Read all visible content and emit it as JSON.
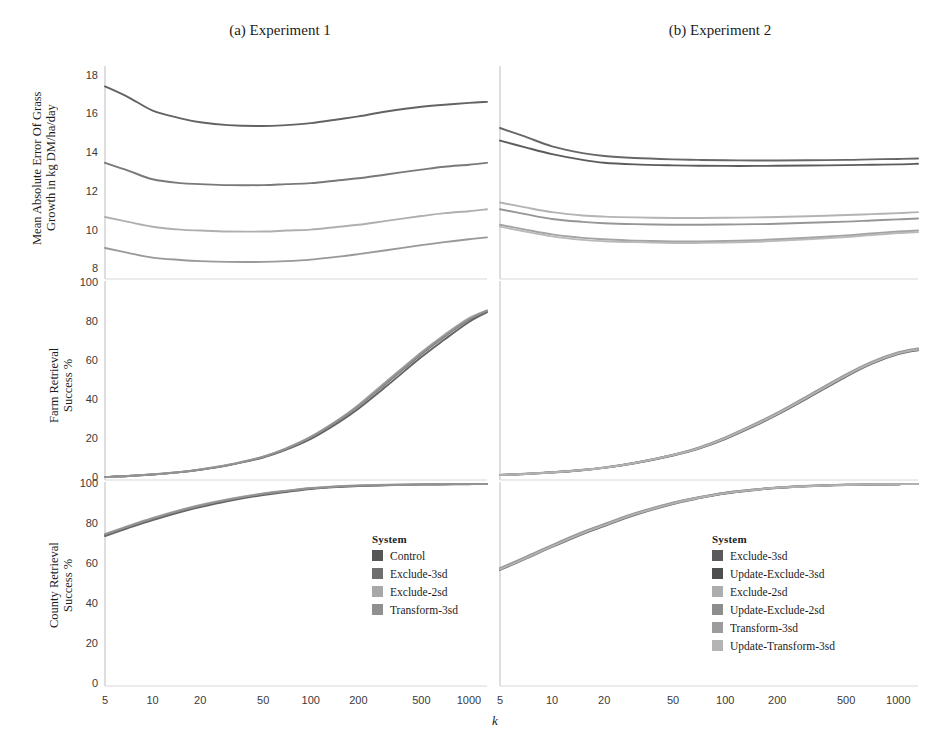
{
  "figure": {
    "panel_titles": [
      "(a) Experiment 1",
      "(b) Experiment 2"
    ],
    "xlabel": "k"
  },
  "axes": {
    "mae_title": "Mean Absolute Error Of Grass\nGrowth in kg DM/ha/day",
    "farm_title": "Farm Retrieval\nSuccess %",
    "county_title": "County Retrieval\nSuccess %",
    "mae_ticks": [
      "8",
      "10",
      "12",
      "14",
      "16",
      "18"
    ],
    "pct_ticks": [
      "0",
      "20",
      "40",
      "60",
      "80",
      "100"
    ],
    "x_ticks": [
      "5",
      "10",
      "20",
      "50",
      "100",
      "200",
      "500",
      "1000"
    ]
  },
  "legends": {
    "a": {
      "title": "System",
      "items": [
        {
          "label": "Control",
          "color": "#565656"
        },
        {
          "label": "Exclude-3sd",
          "color": "#6e6e6e"
        },
        {
          "label": "Exclude-2sd",
          "color": "#a8a8a8"
        },
        {
          "label": "Transform-3sd",
          "color": "#909090"
        }
      ]
    },
    "b": {
      "title": "System",
      "items": [
        {
          "label": "Exclude-3sd",
          "color": "#5a5a5a"
        },
        {
          "label": "Update-Exclude-3sd",
          "color": "#4e4e4e"
        },
        {
          "label": "Exclude-2sd",
          "color": "#adadad"
        },
        {
          "label": "Update-Exclude-2sd",
          "color": "#8d8d8d"
        },
        {
          "label": "Transform-3sd",
          "color": "#9c9c9c"
        },
        {
          "label": "Update-Transform-3sd",
          "color": "#b4b4b4"
        }
      ]
    }
  },
  "chart_data": [
    {
      "type": "line",
      "title": "(a) Experiment 1 — Mean Absolute Error",
      "xlabel": "k",
      "ylabel": "Mean Absolute Error Of Grass Growth in kg DM/ha/day",
      "xscale": "log",
      "xlim": [
        5,
        1300
      ],
      "ylim": [
        7.6,
        18.4
      ],
      "x": [
        5,
        7,
        10,
        15,
        20,
        30,
        50,
        70,
        100,
        150,
        200,
        300,
        500,
        700,
        1000,
        1300
      ],
      "series": [
        {
          "name": "Control",
          "color": "#565656",
          "values": [
            17.45,
            16.9,
            16.2,
            15.8,
            15.6,
            15.45,
            15.4,
            15.45,
            15.55,
            15.75,
            15.9,
            16.15,
            16.4,
            16.5,
            16.6,
            16.65
          ]
        },
        {
          "name": "Exclude-3sd",
          "color": "#6e6e6e",
          "values": [
            13.5,
            13.1,
            12.65,
            12.45,
            12.4,
            12.35,
            12.35,
            12.4,
            12.45,
            12.6,
            12.7,
            12.9,
            13.15,
            13.3,
            13.4,
            13.5
          ]
        },
        {
          "name": "Exclude-2sd",
          "color": "#a8a8a8",
          "values": [
            10.7,
            10.45,
            10.2,
            10.05,
            10.0,
            9.95,
            9.95,
            10.0,
            10.05,
            10.2,
            10.3,
            10.5,
            10.75,
            10.9,
            11.0,
            11.1
          ]
        },
        {
          "name": "Transform-3sd",
          "color": "#909090",
          "values": [
            9.1,
            8.85,
            8.6,
            8.48,
            8.42,
            8.38,
            8.38,
            8.42,
            8.5,
            8.65,
            8.78,
            8.98,
            9.25,
            9.4,
            9.55,
            9.65
          ]
        }
      ]
    },
    {
      "type": "line",
      "title": "(a) Experiment 1 — Farm Retrieval Success",
      "xlabel": "k",
      "ylabel": "Farm Retrieval Success %",
      "xscale": "log",
      "xlim": [
        5,
        1300
      ],
      "ylim": [
        0,
        100
      ],
      "x": [
        5,
        7,
        10,
        15,
        20,
        30,
        50,
        70,
        100,
        150,
        200,
        300,
        500,
        700,
        1000,
        1300
      ],
      "series": [
        {
          "name": "Control",
          "color": "#565656",
          "values": [
            0.5,
            1.0,
            1.8,
            3.0,
            4.2,
            6.5,
            10.5,
            14.5,
            20.0,
            28.5,
            35.5,
            47.0,
            62.0,
            71.0,
            80.0,
            85.0
          ]
        },
        {
          "name": "Exclude-3sd",
          "color": "#6e6e6e",
          "values": [
            0.5,
            1.0,
            1.8,
            3.0,
            4.3,
            6.6,
            10.8,
            15.0,
            20.8,
            29.5,
            36.8,
            48.5,
            63.5,
            72.5,
            81.0,
            85.5
          ]
        },
        {
          "name": "Exclude-2sd",
          "color": "#a8a8a8",
          "values": [
            0.5,
            1.0,
            1.9,
            3.1,
            4.4,
            6.8,
            11.0,
            15.3,
            21.2,
            30.0,
            37.5,
            49.5,
            64.5,
            73.5,
            82.0,
            86.0
          ]
        },
        {
          "name": "Transform-3sd",
          "color": "#909090",
          "values": [
            0.5,
            1.0,
            1.85,
            3.05,
            4.35,
            6.7,
            10.9,
            15.1,
            21.0,
            29.8,
            37.0,
            49.0,
            64.0,
            73.0,
            81.5,
            85.8
          ]
        }
      ]
    },
    {
      "type": "line",
      "title": "(a) Experiment 1 — County Retrieval Success",
      "xlabel": "k",
      "ylabel": "County Retrieval Success %",
      "xscale": "log",
      "xlim": [
        5,
        1300
      ],
      "ylim": [
        0,
        100
      ],
      "x": [
        5,
        7,
        10,
        15,
        20,
        30,
        50,
        70,
        100,
        150,
        200,
        300,
        500,
        700,
        1000,
        1300
      ],
      "series": [
        {
          "name": "Control",
          "color": "#565656",
          "values": [
            74.0,
            78.0,
            82.0,
            86.0,
            88.5,
            91.5,
            94.5,
            96.0,
            97.5,
            98.5,
            99.0,
            99.4,
            99.7,
            99.8,
            99.9,
            100.0
          ]
        },
        {
          "name": "Exclude-3sd",
          "color": "#6e6e6e",
          "values": [
            74.5,
            78.5,
            82.5,
            86.5,
            89.0,
            92.0,
            95.0,
            96.4,
            97.8,
            98.7,
            99.1,
            99.5,
            99.8,
            99.9,
            100.0,
            100.0
          ]
        },
        {
          "name": "Exclude-2sd",
          "color": "#a8a8a8",
          "values": [
            75.0,
            79.0,
            83.0,
            87.0,
            89.5,
            92.4,
            95.3,
            96.7,
            98.0,
            98.9,
            99.3,
            99.6,
            99.8,
            99.9,
            100.0,
            100.0
          ]
        },
        {
          "name": "Transform-3sd",
          "color": "#909090",
          "values": [
            74.8,
            78.8,
            82.8,
            86.8,
            89.2,
            92.2,
            95.1,
            96.5,
            97.9,
            98.8,
            99.2,
            99.5,
            99.8,
            99.9,
            100.0,
            100.0
          ]
        }
      ]
    },
    {
      "type": "line",
      "title": "(b) Experiment 2 — Mean Absolute Error",
      "xlabel": "k",
      "ylabel": "Mean Absolute Error Of Grass Growth in kg DM/ha/day",
      "xscale": "log",
      "xlim": [
        5,
        1300
      ],
      "ylim": [
        7.6,
        18.4
      ],
      "x": [
        5,
        7,
        10,
        15,
        20,
        30,
        50,
        70,
        100,
        150,
        200,
        300,
        500,
        700,
        1000,
        1300
      ],
      "series": [
        {
          "name": "Exclude-3sd",
          "color": "#5a5a5a",
          "values": [
            15.3,
            14.85,
            14.35,
            14.0,
            13.85,
            13.75,
            13.68,
            13.65,
            13.63,
            13.62,
            13.62,
            13.63,
            13.65,
            13.68,
            13.7,
            13.72
          ]
        },
        {
          "name": "Update-Exclude-3sd",
          "color": "#4e4e4e",
          "values": [
            14.65,
            14.3,
            13.95,
            13.65,
            13.5,
            13.42,
            13.37,
            13.35,
            13.34,
            13.34,
            13.35,
            13.36,
            13.38,
            13.4,
            13.42,
            13.45
          ]
        },
        {
          "name": "Exclude-2sd",
          "color": "#adadad",
          "values": [
            11.45,
            11.2,
            10.95,
            10.78,
            10.72,
            10.68,
            10.65,
            10.65,
            10.66,
            10.68,
            10.7,
            10.74,
            10.8,
            10.85,
            10.9,
            10.95
          ]
        },
        {
          "name": "Update-Exclude-2sd",
          "color": "#8d8d8d",
          "values": [
            11.1,
            10.85,
            10.6,
            10.45,
            10.38,
            10.33,
            10.3,
            10.3,
            10.31,
            10.33,
            10.35,
            10.4,
            10.46,
            10.52,
            10.58,
            10.62
          ]
        },
        {
          "name": "Transform-3sd",
          "color": "#9c9c9c",
          "values": [
            10.3,
            10.05,
            9.8,
            9.62,
            9.55,
            9.48,
            9.44,
            9.44,
            9.46,
            9.5,
            9.55,
            9.63,
            9.75,
            9.85,
            9.95,
            10.0
          ]
        },
        {
          "name": "Update-Transform-3sd",
          "color": "#b4b4b4",
          "values": [
            10.2,
            9.95,
            9.7,
            9.52,
            9.45,
            9.4,
            9.36,
            9.36,
            9.38,
            9.42,
            9.47,
            9.55,
            9.67,
            9.77,
            9.87,
            9.92
          ]
        }
      ]
    },
    {
      "type": "line",
      "title": "(b) Experiment 2 — Farm Retrieval Success",
      "xlabel": "k",
      "ylabel": "Farm Retrieval Success %",
      "xscale": "log",
      "xlim": [
        5,
        1300
      ],
      "ylim": [
        0,
        100
      ],
      "x": [
        5,
        7,
        10,
        15,
        20,
        30,
        50,
        70,
        100,
        150,
        200,
        300,
        500,
        700,
        1000,
        1300
      ],
      "series": [
        {
          "name": "Exclude-3sd",
          "color": "#5a5a5a",
          "values": [
            1.5,
            2.0,
            2.8,
            4.0,
            5.2,
            7.5,
            11.5,
            15.0,
            20.0,
            27.0,
            32.5,
            41.0,
            52.0,
            58.5,
            63.5,
            65.5
          ]
        },
        {
          "name": "Update-Exclude-3sd",
          "color": "#4e4e4e",
          "values": [
            1.5,
            2.1,
            2.9,
            4.1,
            5.3,
            7.7,
            11.8,
            15.3,
            20.4,
            27.5,
            33.0,
            41.6,
            52.6,
            59.0,
            64.0,
            66.0
          ]
        },
        {
          "name": "Exclude-2sd",
          "color": "#adadad",
          "values": [
            1.6,
            2.2,
            3.0,
            4.2,
            5.4,
            7.8,
            12.0,
            15.6,
            20.8,
            28.0,
            33.5,
            42.2,
            53.2,
            59.6,
            64.5,
            66.5
          ]
        },
        {
          "name": "Update-Exclude-2sd",
          "color": "#8d8d8d",
          "values": [
            1.6,
            2.15,
            2.95,
            4.15,
            5.35,
            7.75,
            11.9,
            15.45,
            20.6,
            27.8,
            33.3,
            42.0,
            53.0,
            59.3,
            64.3,
            66.3
          ]
        },
        {
          "name": "Transform-3sd",
          "color": "#9c9c9c",
          "values": [
            1.55,
            2.1,
            2.9,
            4.1,
            5.3,
            7.7,
            11.85,
            15.4,
            20.5,
            27.6,
            33.1,
            41.8,
            52.8,
            59.1,
            64.1,
            66.1
          ]
        },
        {
          "name": "Update-Transform-3sd",
          "color": "#b4b4b4",
          "values": [
            1.55,
            2.05,
            2.85,
            4.05,
            5.25,
            7.6,
            11.7,
            15.2,
            20.3,
            27.4,
            32.9,
            41.5,
            52.5,
            58.9,
            63.9,
            65.9
          ]
        }
      ]
    },
    {
      "type": "line",
      "title": "(b) Experiment 2 — County Retrieval Success",
      "xlabel": "k",
      "ylabel": "County Retrieval Success %",
      "xscale": "log",
      "xlim": [
        5,
        1300
      ],
      "ylim": [
        0,
        100
      ],
      "x": [
        5,
        7,
        10,
        15,
        20,
        30,
        50,
        70,
        100,
        150,
        200,
        300,
        500,
        700,
        1000,
        1300
      ],
      "series": [
        {
          "name": "Exclude-3sd",
          "color": "#5a5a5a",
          "values": [
            57.0,
            62.5,
            68.5,
            75.0,
            79.0,
            84.5,
            90.0,
            92.8,
            95.2,
            97.0,
            98.0,
            98.9,
            99.5,
            99.7,
            99.9,
            100.0
          ]
        },
        {
          "name": "Update-Exclude-3sd",
          "color": "#4e4e4e",
          "values": [
            57.5,
            63.0,
            69.0,
            75.5,
            79.5,
            85.0,
            90.4,
            93.1,
            95.4,
            97.2,
            98.1,
            99.0,
            99.6,
            99.8,
            99.9,
            100.0
          ]
        },
        {
          "name": "Exclude-2sd",
          "color": "#adadad",
          "values": [
            58.0,
            63.5,
            69.5,
            76.0,
            80.0,
            85.4,
            90.8,
            93.4,
            95.7,
            97.4,
            98.3,
            99.1,
            99.6,
            99.8,
            100.0,
            100.0
          ]
        },
        {
          "name": "Update-Exclude-2sd",
          "color": "#8d8d8d",
          "values": [
            57.8,
            63.3,
            69.3,
            75.8,
            79.8,
            85.2,
            90.6,
            93.3,
            95.6,
            97.3,
            98.2,
            99.0,
            99.6,
            99.8,
            99.9,
            100.0
          ]
        },
        {
          "name": "Transform-3sd",
          "color": "#9c9c9c",
          "values": [
            57.6,
            63.1,
            69.1,
            75.6,
            79.6,
            85.1,
            90.5,
            93.2,
            95.5,
            97.2,
            98.2,
            99.0,
            99.6,
            99.8,
            99.9,
            100.0
          ]
        },
        {
          "name": "Update-Transform-3sd",
          "color": "#b4b4b4",
          "values": [
            57.3,
            62.8,
            68.8,
            75.3,
            79.3,
            84.8,
            90.2,
            93.0,
            95.3,
            97.1,
            98.1,
            98.9,
            99.5,
            99.8,
            99.9,
            100.0
          ]
        }
      ]
    }
  ]
}
